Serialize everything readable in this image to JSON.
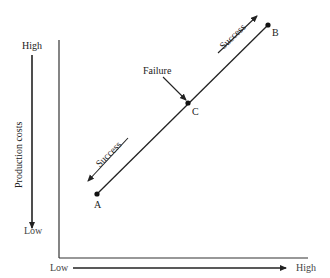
{
  "diagram": {
    "y_axis": {
      "label": "Production costs",
      "high_label": "High",
      "low_label": "Low"
    },
    "x_axis": {
      "label": "Product differentiation",
      "low_label": "Low",
      "high_label": "High"
    },
    "points": [
      {
        "id": "A",
        "label": "A"
      },
      {
        "id": "B",
        "label": "B"
      },
      {
        "id": "C",
        "label": "C"
      }
    ],
    "annotations": {
      "failure": "Failure",
      "success_upper": "Success",
      "success_lower": "Success"
    },
    "colors": {
      "ink": "#222222",
      "background": "#ffffff"
    }
  }
}
